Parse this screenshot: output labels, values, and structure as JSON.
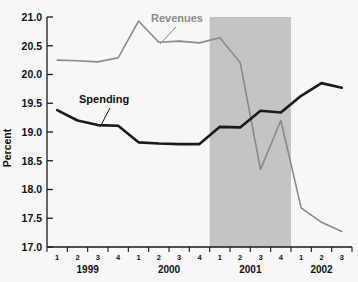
{
  "chart_data": {
    "type": "line",
    "title": "",
    "xlabel": "",
    "ylabel": "Percent",
    "ylim": [
      17.0,
      21.0
    ],
    "ytick_step": 0.5,
    "grid": false,
    "legend_position": "inline-annotations",
    "yticks": [
      "21.0",
      "20.5",
      "20.0",
      "19.5",
      "19.0",
      "18.5",
      "18.0",
      "17.5",
      "17.0"
    ],
    "ytick_values": [
      21.0,
      20.5,
      20.0,
      19.5,
      19.0,
      18.5,
      18.0,
      17.5,
      17.0
    ],
    "x": [
      "1999 Q1",
      "1999 Q2",
      "1999 Q3",
      "1999 Q4",
      "2000 Q1",
      "2000 Q2",
      "2000 Q3",
      "2000 Q4",
      "2001 Q1",
      "2001 Q2",
      "2001 Q3",
      "2001 Q4",
      "2002 Q1",
      "2002 Q2",
      "2002 Q3"
    ],
    "quarter_labels": [
      "1",
      "2",
      "3",
      "4",
      "1",
      "2",
      "3",
      "4",
      "1",
      "2",
      "3",
      "4",
      "1",
      "2",
      "3"
    ],
    "year_groups": [
      {
        "label": "1999",
        "start_index": 0,
        "count": 4
      },
      {
        "label": "2000",
        "start_index": 4,
        "count": 4
      },
      {
        "label": "2001",
        "start_index": 8,
        "count": 4
      },
      {
        "label": "2002",
        "start_index": 12,
        "count": 3
      }
    ],
    "series": [
      {
        "name": "Revenues",
        "color": "#8a8a8a",
        "line_width": 1.6,
        "values": [
          20.25,
          20.24,
          20.22,
          20.29,
          20.93,
          20.56,
          20.58,
          20.55,
          20.64,
          20.21,
          18.35,
          19.2,
          17.68,
          17.43,
          17.27
        ]
      },
      {
        "name": "Spending",
        "color": "#1a1a1a",
        "line_width": 2.6,
        "values": [
          19.38,
          19.2,
          19.12,
          19.11,
          18.82,
          18.8,
          18.79,
          18.79,
          19.09,
          19.08,
          19.37,
          19.34,
          19.63,
          19.85,
          19.77
        ]
      }
    ],
    "shaded_region": {
      "name": "recession-band",
      "color": "#c4c4c4",
      "start_x": "2001 Q1",
      "end_x": "2001 Q4",
      "start_index": 7.5,
      "end_index": 11.5
    },
    "annotations": [
      {
        "name": "revenues-label",
        "text": "Revenues",
        "color": "#8a8a8a",
        "text_x": 151,
        "text_y": 22,
        "leader_from_x": 176,
        "leader_from_y": 27,
        "leader_to_x": 160,
        "leader_to_y": 44
      },
      {
        "name": "spending-label",
        "text": "Spending",
        "color": "#101010",
        "text_x": 79,
        "text_y": 103,
        "leader_from_x": 110,
        "leader_from_y": 108,
        "leader_to_x": 100,
        "leader_to_y": 127
      }
    ]
  },
  "axis": {
    "y_title": "Percent"
  }
}
